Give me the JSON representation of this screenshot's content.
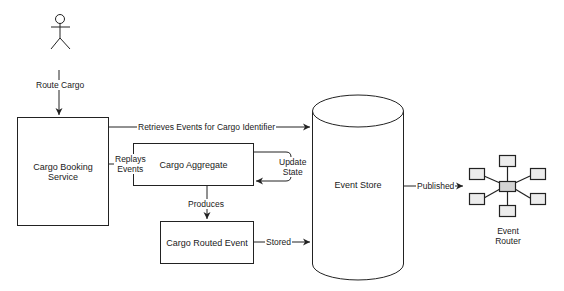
{
  "diagram": {
    "type": "event-sourcing-flow",
    "colors": {
      "stroke": "#222222",
      "fill": "#ffffff",
      "router_center": "#d4d4d4",
      "router_satellite": "#ececec"
    },
    "nodes": {
      "actor": {
        "shape": "stick-figure",
        "label": ""
      },
      "cargo_booking_service": {
        "label": "Cargo Booking Service"
      },
      "cargo_aggregate": {
        "label": "Cargo Aggregate"
      },
      "cargo_routed_event": {
        "label": "Cargo Routed Event"
      },
      "event_store": {
        "label": "Event Store"
      },
      "event_router": {
        "label_line1": "Event",
        "label_line2": "Router"
      }
    },
    "edges": {
      "route_cargo": {
        "from": "actor",
        "to": "cargo_booking_service",
        "label": "Route Cargo"
      },
      "retrieves_events": {
        "from": "cargo_booking_service",
        "to": "event_store",
        "label": "Retrieves Events for Cargo Identifier"
      },
      "replays_events": {
        "from": "cargo_booking_service",
        "to": "cargo_aggregate",
        "label_line1": "Replays",
        "label_line2": "Events"
      },
      "update_state": {
        "from": "cargo_aggregate",
        "to": "cargo_aggregate",
        "label_line1": "Update",
        "label_line2": "State"
      },
      "produces": {
        "from": "cargo_aggregate",
        "to": "cargo_routed_event",
        "label": "Produces"
      },
      "stored": {
        "from": "cargo_routed_event",
        "to": "event_store",
        "label": "Stored"
      },
      "published": {
        "from": "event_store",
        "to": "event_router",
        "label": "Published"
      }
    }
  }
}
